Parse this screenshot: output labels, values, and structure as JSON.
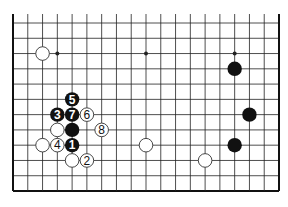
{
  "diagram": {
    "type": "go-board-partial",
    "columns": 19,
    "visible_rows": 12,
    "edges": {
      "left": true,
      "right": true,
      "bottom": true,
      "top": false
    },
    "geometry": {
      "x0": 13,
      "x1": 279,
      "y0": 23,
      "y1": 191,
      "top_line_start": 14
    },
    "colors": {
      "line": "#222222",
      "border": "#111111",
      "black_stone": "#111111",
      "white_stone": "#ffffff",
      "white_outline": "#333333",
      "label_on_black": "#ffffff",
      "label_on_white": "#111111"
    },
    "star_points": [
      {
        "col": 3,
        "row": 2
      },
      {
        "col": 9,
        "row": 2
      },
      {
        "col": 15,
        "row": 2
      }
    ],
    "stones": [
      {
        "color": "white",
        "col": 2,
        "row": 2,
        "label": ""
      },
      {
        "color": "black",
        "col": 15,
        "row": 3,
        "label": ""
      },
      {
        "color": "black",
        "col": 16,
        "row": 6,
        "label": ""
      },
      {
        "color": "black",
        "col": 15,
        "row": 8,
        "label": ""
      },
      {
        "color": "white",
        "col": 9,
        "row": 8,
        "label": ""
      },
      {
        "color": "white",
        "col": 13,
        "row": 9,
        "label": ""
      },
      {
        "color": "black",
        "col": 4,
        "row": 5,
        "label": "5"
      },
      {
        "color": "black",
        "col": 3,
        "row": 6,
        "label": "3"
      },
      {
        "color": "black",
        "col": 4,
        "row": 6,
        "label": "7"
      },
      {
        "color": "white",
        "col": 5,
        "row": 6,
        "label": "6"
      },
      {
        "color": "white",
        "col": 3,
        "row": 7,
        "label": ""
      },
      {
        "color": "black",
        "col": 4,
        "row": 7,
        "label": ""
      },
      {
        "color": "white",
        "col": 6,
        "row": 7,
        "label": "8"
      },
      {
        "color": "white",
        "col": 2,
        "row": 8,
        "label": ""
      },
      {
        "color": "white",
        "col": 3,
        "row": 8,
        "label": "4"
      },
      {
        "color": "black",
        "col": 4,
        "row": 8,
        "label": "1"
      },
      {
        "color": "white",
        "col": 4,
        "row": 9,
        "label": ""
      },
      {
        "color": "white",
        "col": 5,
        "row": 9,
        "label": "2"
      }
    ]
  }
}
